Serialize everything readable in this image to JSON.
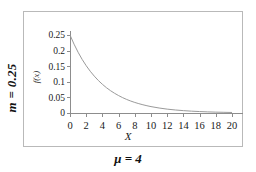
{
  "labels": {
    "row_parameter": "m = 0.25",
    "column_parameter": "μ = 4"
  },
  "chart_data": {
    "type": "line",
    "title": "",
    "subtitle": "",
    "xlabel": "X",
    "ylabel": "f(x)",
    "xlim": [
      0,
      20
    ],
    "ylim": [
      0,
      0.25
    ],
    "grid": false,
    "legend": null,
    "curve_color": "#9a9a9a",
    "axis_color": "#8d8d8d",
    "frame_color": "#b9b9b9",
    "equation": "f(x) = 0.25 * exp(-0.25 * x)",
    "xticks": [
      0,
      2,
      4,
      6,
      8,
      10,
      12,
      14,
      16,
      18,
      20
    ],
    "xticklabels": [
      "0",
      "2",
      "4",
      "6",
      "8",
      "10",
      "12",
      "14",
      "16",
      "18",
      "20"
    ],
    "yticks": [
      0,
      0.05,
      0.1,
      0.15,
      0.2,
      0.25
    ],
    "yticklabels": [
      "0",
      "0.05",
      "0.1",
      "0.15",
      "0.2",
      "0.25"
    ],
    "series": [
      {
        "name": "f(x)",
        "x": [
          0,
          0.5,
          1,
          1.5,
          2,
          2.5,
          3,
          3.5,
          4,
          4.5,
          5,
          5.5,
          6,
          6.5,
          7,
          7.5,
          8,
          8.5,
          9,
          9.5,
          10,
          11,
          12,
          13,
          14,
          15,
          16,
          17,
          18,
          19,
          20
        ],
        "values": [
          0.25,
          0.2206,
          0.1947,
          0.1718,
          0.1516,
          0.1338,
          0.1181,
          0.1042,
          0.092,
          0.0811,
          0.0716,
          0.0632,
          0.0558,
          0.0492,
          0.0434,
          0.0383,
          0.0338,
          0.0299,
          0.0264,
          0.0233,
          0.0205,
          0.016,
          0.0124,
          0.0097,
          0.0076,
          0.0059,
          0.0046,
          0.0036,
          0.0028,
          0.0022,
          0.0017
        ]
      }
    ]
  }
}
